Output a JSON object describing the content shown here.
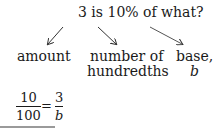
{
  "question": "3 is 10% of what?",
  "labels": {
    "amount": "amount",
    "hundredths_line1": "number of",
    "hundredths_line2": "hundredths",
    "base_line1": "base,",
    "base_line2": "b"
  },
  "equation": {
    "left_num": "10",
    "left_den": "100",
    "equals": "=",
    "right_num": "3",
    "right_den": "b"
  }
}
